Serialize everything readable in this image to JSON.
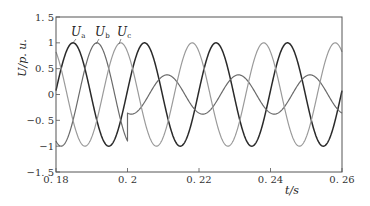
{
  "chart_data": {
    "type": "line",
    "title": "",
    "xlabel": "t/s",
    "ylabel": "U/p. u.",
    "xlim": [
      0.18,
      0.26
    ],
    "ylim": [
      -1.5,
      1.5
    ],
    "grid": false,
    "x_ticks": [
      0.18,
      0.2,
      0.22,
      0.24,
      0.26
    ],
    "x_tick_labels": [
      "0. 18",
      "0. 2",
      "0. 22",
      "0. 24",
      "0. 26"
    ],
    "y_ticks": [
      1.5,
      1,
      0.5,
      0,
      -0.5,
      -1,
      -1.5
    ],
    "y_tick_labels": [
      "1. 5",
      "1",
      "0. 5",
      "0",
      "−0. 5",
      "−1",
      "−1. 5"
    ],
    "event_time": 0.2,
    "legend_position": "inline-top-left",
    "series": [
      {
        "name": "Ua",
        "label_main": "U",
        "label_sub": "a",
        "color": "#2a2a2a",
        "width": 1.5,
        "segments": [
          {
            "t_start": 0.18,
            "t_end": 0.26,
            "amplitude": 1.0,
            "peak_time": 0.18476
          }
        ]
      },
      {
        "name": "Ub",
        "label_main": "U",
        "label_sub": "b",
        "color": "#6a6a6a",
        "width": 1.2,
        "segments": [
          {
            "t_start": 0.18,
            "t_end": 0.2,
            "amplitude": 1.0,
            "peak_time": 0.19143
          },
          {
            "t_start": 0.2,
            "t_end": 0.26,
            "amplitude": 0.38,
            "peak_time": 0.21105
          }
        ]
      },
      {
        "name": "Uc",
        "label_main": "U",
        "label_sub": "c",
        "color": "#9a9a9a",
        "width": 1.2,
        "segments": [
          {
            "t_start": 0.18,
            "t_end": 0.26,
            "amplitude": 1.0,
            "peak_time": 0.19809
          }
        ]
      }
    ],
    "frequency_hz": 50
  }
}
